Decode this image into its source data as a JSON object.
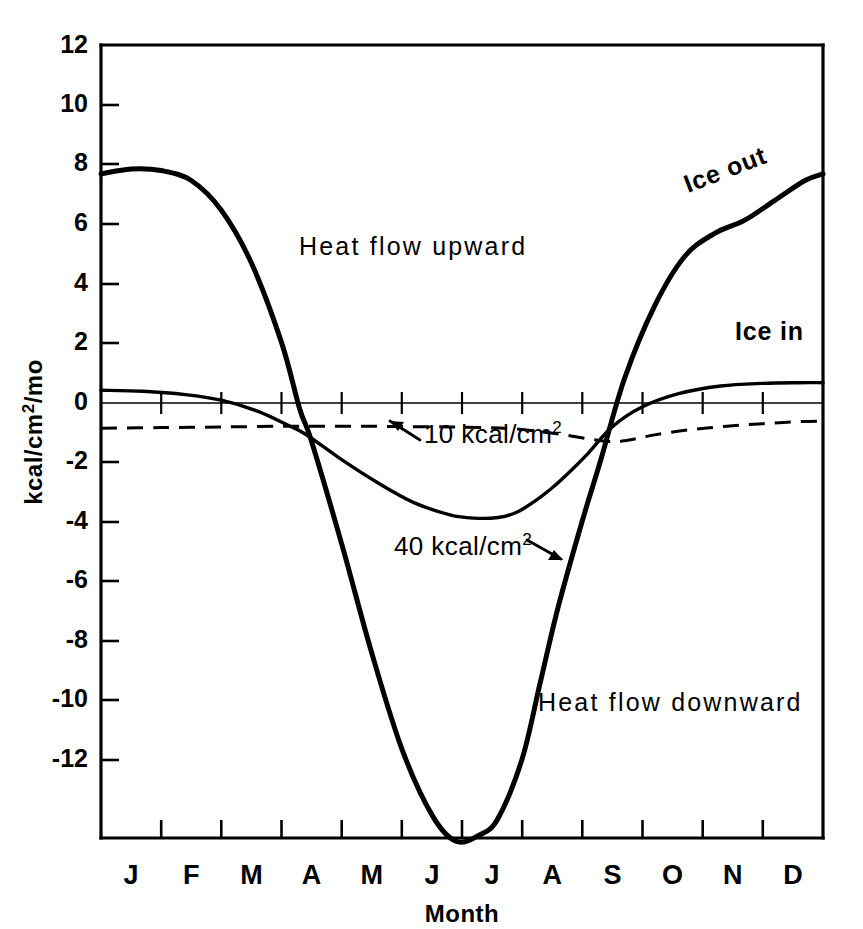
{
  "chart_data": {
    "type": "line",
    "title": "",
    "xlabel": "Month",
    "ylabel": "kcal/cm2/mo",
    "ylabel_display": "kcal/cm²/mo",
    "xlim": [
      0,
      12
    ],
    "ylim": [
      -12,
      12
    ],
    "ytick_values": [
      12,
      10,
      8,
      6,
      4,
      2,
      0,
      -2,
      -4,
      -6,
      -8,
      -10,
      -12
    ],
    "ytick_labels": [
      "12",
      "10",
      "8",
      "6",
      "4",
      "2",
      "0",
      "-2",
      "-4",
      "-6",
      "-8",
      "-10",
      "-12"
    ],
    "categories": [
      "J",
      "F",
      "M",
      "A",
      "M",
      "J",
      "J",
      "A",
      "S",
      "O",
      "N",
      "D"
    ],
    "grid": false,
    "legend_position": "inline-annotations",
    "series": [
      {
        "name": "40 kcal/cm2",
        "style": "solid-thick",
        "x": [
          0.0,
          0.5,
          1.0,
          1.5,
          2.0,
          2.5,
          3.0,
          3.3,
          3.5,
          4.0,
          4.5,
          5.0,
          5.5,
          5.9,
          6.3,
          6.6,
          7.0,
          7.3,
          7.6,
          8.0,
          8.3,
          8.7,
          9.2,
          9.7,
          10.2,
          10.7,
          11.2,
          11.7,
          12.0
        ],
        "values": [
          8.1,
          8.25,
          8.2,
          7.9,
          7.0,
          5.4,
          3.0,
          1.0,
          0.0,
          -3.1,
          -6.4,
          -9.3,
          -11.3,
          -12.1,
          -11.9,
          -11.4,
          -9.6,
          -7.3,
          -5.0,
          -2.4,
          -0.6,
          1.9,
          4.1,
          5.6,
          6.3,
          6.7,
          7.3,
          7.9,
          8.1
        ]
      },
      {
        "name": "10 kcal/cm2",
        "style": "solid-medium",
        "x": [
          0.0,
          0.7,
          1.4,
          2.0,
          2.6,
          3.1,
          3.4,
          4.0,
          4.6,
          5.2,
          5.8,
          6.2,
          6.6,
          6.9,
          7.2,
          7.5,
          7.8,
          8.1,
          8.5,
          9.0,
          9.6,
          10.3,
          11.0,
          11.6,
          12.0
        ],
        "values": [
          1.55,
          1.52,
          1.42,
          1.25,
          0.92,
          0.5,
          0.22,
          -0.55,
          -1.25,
          -1.85,
          -2.22,
          -2.32,
          -2.3,
          -2.15,
          -1.82,
          -1.4,
          -0.9,
          -0.35,
          0.45,
          1.05,
          1.45,
          1.68,
          1.76,
          1.78,
          1.78
        ]
      },
      {
        "name": "dashed-reference",
        "style": "dashed",
        "x": [
          0.0,
          1.0,
          2.0,
          3.0,
          3.7,
          4.4,
          5.1,
          5.8,
          6.4,
          6.9,
          7.3,
          7.7,
          8.1,
          8.45,
          8.7,
          9.2,
          9.8,
          10.4,
          11.0,
          11.6,
          12.0
        ],
        "values": [
          0.4,
          0.42,
          0.44,
          0.46,
          0.46,
          0.46,
          0.45,
          0.44,
          0.42,
          0.38,
          0.3,
          0.2,
          0.08,
          0.0,
          0.02,
          0.2,
          0.36,
          0.46,
          0.54,
          0.6,
          0.62
        ]
      }
    ],
    "annotations": [
      {
        "id": "heat-flow-upward",
        "text": "Heat flow upward",
        "x_px": 299,
        "y_px": 255,
        "rotation": 0
      },
      {
        "id": "heat-flow-downward",
        "text": "Heat flow downward",
        "x_px": 538,
        "y_px": 711,
        "rotation": 0
      },
      {
        "id": "ice-out",
        "text": "Ice out",
        "x_px": 688,
        "y_px": 193,
        "rotation": -21
      },
      {
        "id": "ice-in",
        "text": "Ice in",
        "x_px": 735,
        "y_px": 340,
        "rotation": 0
      },
      {
        "id": "label-10-kcal",
        "text": "10 kcal/cm",
        "superscript": "2",
        "x_px": 424,
        "y_px": 434,
        "rotation": 0
      },
      {
        "id": "label-40-kcal",
        "text": "40 kcal/cm",
        "superscript": "2",
        "x_px": 394,
        "y_px": 546,
        "rotation": 0
      }
    ]
  }
}
